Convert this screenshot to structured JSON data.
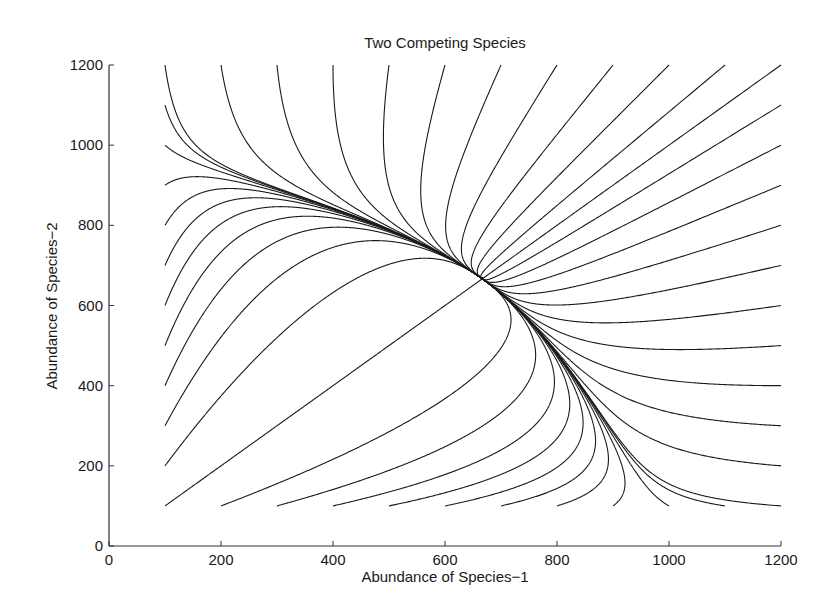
{
  "chart_data": {
    "type": "line",
    "title": "Two Competing Species",
    "xlabel": "Abundance of Species−1",
    "ylabel": "Abundance of Species−2",
    "xlim": [
      0,
      1200
    ],
    "ylim": [
      0,
      1200
    ],
    "xticks": [
      0,
      200,
      400,
      600,
      800,
      1000,
      1200
    ],
    "yticks": [
      0,
      200,
      400,
      600,
      800,
      1000,
      1200
    ],
    "grid": false,
    "legend": null,
    "line_color": "#1a1a1a",
    "model": {
      "equations": "dx/dt = r*x*(1-(x+a*y)/K); dy/dt = r*y*(1-(y+a*x)/K)",
      "r": 1.0,
      "K": 1000,
      "a": 0.5
    },
    "equilibrium": [
      667,
      667
    ],
    "initial_conditions": {
      "left_edge": {
        "x": 100,
        "y": [
          100,
          200,
          300,
          400,
          500,
          600,
          700,
          800,
          900,
          1000,
          1100,
          1200
        ]
      },
      "top_edge": {
        "y": 1200,
        "x": [
          200,
          300,
          400,
          500,
          600,
          700,
          800,
          900,
          1000,
          1100,
          1200
        ]
      },
      "right_edge": {
        "x": 1200,
        "y": [
          100,
          200,
          300,
          400,
          500,
          600,
          700,
          800,
          900,
          1000,
          1100
        ]
      },
      "bottom_edge": {
        "y": 100,
        "x": [
          200,
          300,
          400,
          500,
          600,
          700,
          800,
          900,
          1000,
          1100
        ]
      }
    }
  }
}
